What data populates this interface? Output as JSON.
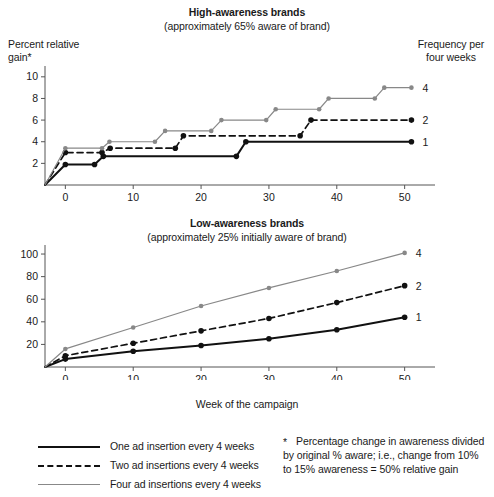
{
  "figure": {
    "xlabel": "Week of the campaign"
  },
  "panels": [
    {
      "id": "high",
      "title": "High-awareness brands",
      "subtitle": "(approximately 65% aware of brand)",
      "ylabel_line1": "Percent relative",
      "ylabel_line2": "gain*",
      "right_label_line1": "Frequency per",
      "right_label_line2": "four weeks",
      "series_end_labels": [
        "4",
        "2",
        "1"
      ]
    },
    {
      "id": "low",
      "title": "Low-awareness brands",
      "subtitle": "(approximately 25% initially aware of brand)",
      "series_end_labels": [
        "4",
        "2",
        "1"
      ]
    }
  ],
  "legend": {
    "position": "bottom-left",
    "items": [
      {
        "label": "One ad insertion every 4 weeks",
        "style": "solid",
        "color": "#111111",
        "frequency": 1
      },
      {
        "label": "Two ad insertions every 4 weeks",
        "style": "dashed",
        "color": "#111111",
        "frequency": 2
      },
      {
        "label": "Four ad insertions every 4 weeks",
        "style": "solid",
        "color": "#888888",
        "frequency": 4
      }
    ]
  },
  "footnote": {
    "marker": "*",
    "text": "Percentage change in awareness divided by original % aware; i.e., change from 10% to 15% awareness = 50% relative gain"
  },
  "colors": {
    "line_black": "#111111",
    "line_gray": "#888888",
    "axis": "#555555",
    "text": "#1a1a1a"
  },
  "chart_data": [
    {
      "type": "line",
      "subtype": "step",
      "title": "High-awareness brands",
      "subtitle": "(approximately 65% aware of brand)",
      "xlabel": "Week of the campaign",
      "ylabel": "Percent relative gain*",
      "xlim": [
        -3,
        53
      ],
      "ylim": [
        0,
        11
      ],
      "xticks": [
        0,
        10,
        20,
        30,
        40,
        50
      ],
      "yticks": [
        2,
        4,
        6,
        8,
        10
      ],
      "grid": false,
      "legend_position": "right",
      "series": [
        {
          "name": "One ad insertion every 4 weeks",
          "end_label": "1",
          "color": "#111111",
          "style": "solid",
          "points": [
            {
              "x": -3,
              "y": 0
            },
            {
              "x": 0,
              "y": 1.9
            },
            {
              "x": 4.3,
              "y": 1.9
            },
            {
              "x": 5.6,
              "y": 2.65
            },
            {
              "x": 25.2,
              "y": 2.65
            },
            {
              "x": 26.6,
              "y": 4.0
            },
            {
              "x": 51,
              "y": 4.0
            }
          ],
          "markers_at": [
            0,
            4.3,
            5.6,
            25.2,
            26.6,
            51
          ]
        },
        {
          "name": "Two ad insertions every 4 weeks",
          "end_label": "2",
          "color": "#111111",
          "style": "dashed",
          "points": [
            {
              "x": -3,
              "y": 0
            },
            {
              "x": 0,
              "y": 3.0
            },
            {
              "x": 5.4,
              "y": 3.0
            },
            {
              "x": 6.6,
              "y": 3.4
            },
            {
              "x": 16.2,
              "y": 3.4
            },
            {
              "x": 17.4,
              "y": 4.55
            },
            {
              "x": 34.6,
              "y": 4.55
            },
            {
              "x": 36.2,
              "y": 6.0
            },
            {
              "x": 51,
              "y": 6.0
            }
          ],
          "markers_at": [
            0,
            5.4,
            6.6,
            16.2,
            17.4,
            34.6,
            36.2,
            51
          ]
        },
        {
          "name": "Four ad insertions every 4 weeks",
          "end_label": "4",
          "color": "#888888",
          "style": "solid",
          "points": [
            {
              "x": -3,
              "y": 0
            },
            {
              "x": 0,
              "y": 3.4
            },
            {
              "x": 5.4,
              "y": 3.4
            },
            {
              "x": 6.5,
              "y": 4.0
            },
            {
              "x": 13.2,
              "y": 4.0
            },
            {
              "x": 14.7,
              "y": 5.0
            },
            {
              "x": 21.5,
              "y": 5.0
            },
            {
              "x": 23.0,
              "y": 6.0
            },
            {
              "x": 29.6,
              "y": 6.0
            },
            {
              "x": 31.0,
              "y": 7.0
            },
            {
              "x": 37.4,
              "y": 7.0
            },
            {
              "x": 38.8,
              "y": 8.0
            },
            {
              "x": 45.6,
              "y": 8.0
            },
            {
              "x": 47.0,
              "y": 9.0
            },
            {
              "x": 51,
              "y": 9.0
            }
          ],
          "markers_at": [
            0,
            5.4,
            6.5,
            13.2,
            14.7,
            21.5,
            23.0,
            29.6,
            31.0,
            37.4,
            38.8,
            45.6,
            47.0,
            51
          ]
        }
      ]
    },
    {
      "type": "line",
      "title": "Low-awareness brands",
      "subtitle": "(approximately 25% initially aware of brand)",
      "xlabel": "Week of the campaign",
      "ylabel": "Percent relative gain*",
      "xlim": [
        -3,
        53
      ],
      "ylim": [
        0,
        108
      ],
      "xticks": [
        0,
        10,
        20,
        30,
        40,
        50
      ],
      "yticks": [
        20,
        40,
        60,
        80,
        100
      ],
      "grid": false,
      "legend_position": "right",
      "series": [
        {
          "name": "One ad insertion every 4 weeks",
          "end_label": "1",
          "color": "#111111",
          "style": "solid",
          "x": [
            -3,
            0,
            10,
            20,
            30,
            40,
            50
          ],
          "y": [
            0,
            7,
            14,
            19,
            25,
            33,
            44
          ]
        },
        {
          "name": "Two ad insertions every 4 weeks",
          "end_label": "2",
          "color": "#111111",
          "style": "dashed",
          "x": [
            -3,
            0,
            10,
            20,
            30,
            40,
            50
          ],
          "y": [
            0,
            10,
            21,
            32,
            43,
            57,
            72
          ]
        },
        {
          "name": "Four ad insertions every 4 weeks",
          "end_label": "4",
          "color": "#888888",
          "style": "solid",
          "x": [
            -3,
            0,
            10,
            20,
            30,
            40,
            50
          ],
          "y": [
            0,
            16,
            35,
            54,
            70,
            85,
            101
          ]
        }
      ]
    }
  ]
}
